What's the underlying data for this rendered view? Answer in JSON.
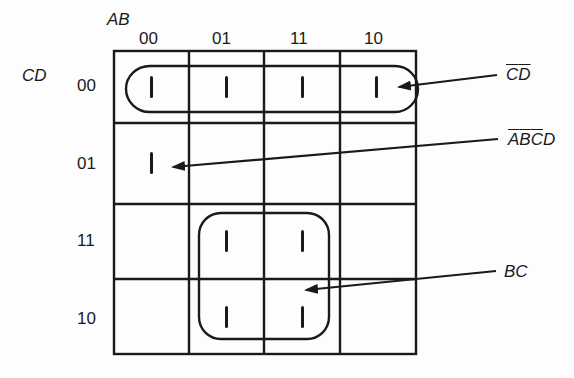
{
  "diagram": {
    "type": "karnaugh-map",
    "variables": {
      "columns": "AB",
      "rows": "CD"
    },
    "column_headers": [
      "00",
      "01",
      "11",
      "10"
    ],
    "row_headers": [
      "00",
      "01",
      "11",
      "10"
    ],
    "cell_mark": "1",
    "cells": [
      [
        "1",
        "1",
        "1",
        "1"
      ],
      [
        "1",
        "",
        "",
        ""
      ],
      [
        "",
        "1",
        "1",
        ""
      ],
      [
        "",
        "1",
        "1",
        ""
      ]
    ],
    "groups": [
      {
        "id": "cd-bar",
        "term_parts": [
          {
            "t": "C",
            "bar": true
          },
          {
            "t": "D",
            "bar": true
          }
        ],
        "term_text": "C̄D̄",
        "cells": "row 00, all columns"
      },
      {
        "id": "abcd",
        "term_parts": [
          {
            "t": "A",
            "bar": true
          },
          {
            "t": "B",
            "bar": true
          },
          {
            "t": "C",
            "bar": true
          },
          {
            "t": "D",
            "bar": false
          }
        ],
        "term_text": "ĀB̄C̄D",
        "cells": "row 01, column 00"
      },
      {
        "id": "bc",
        "term_parts": [
          {
            "t": "B",
            "bar": false
          },
          {
            "t": "C",
            "bar": false
          }
        ],
        "term_text": "BC",
        "cells": "rows 11,10 × columns 01,11"
      }
    ],
    "colors": {
      "ink": "#1a1a1a",
      "background": "#fdfdfd"
    }
  }
}
